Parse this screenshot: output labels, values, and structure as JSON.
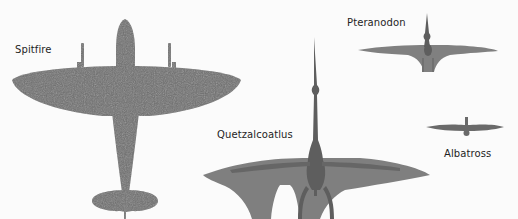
{
  "diagram": {
    "type": "size-comparison",
    "subjects": [
      {
        "id": "spitfire",
        "label": "Spitfire",
        "color": "#6e6e6e"
      },
      {
        "id": "quetzalcoatlus",
        "label": "Quetzalcoatlus",
        "color": "#7f7f7f"
      },
      {
        "id": "pteranodon",
        "label": "Pteranodon",
        "color": "#808080"
      },
      {
        "id": "albatross",
        "label": "Albatross",
        "color": "#6a6a6a"
      }
    ],
    "colors": {
      "background": "#fbfbfb",
      "text": "#1e1e1e",
      "body_dark": "#5e5e5e"
    }
  }
}
